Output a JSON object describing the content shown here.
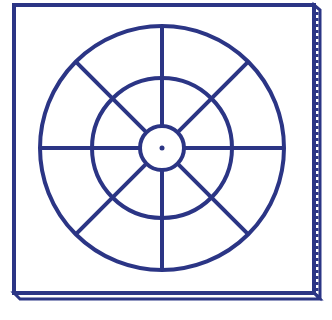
{
  "diagram": {
    "stroke_color": "#2b3585",
    "background": "#ffffff",
    "board": {
      "x": 14,
      "y": 5,
      "width": 300,
      "height": 288
    },
    "center": {
      "x": 162,
      "y": 148
    },
    "circles": [
      {
        "name": "outer",
        "r": 122
      },
      {
        "name": "middle",
        "r": 70
      },
      {
        "name": "inner",
        "r": 22
      }
    ],
    "spokes": 8,
    "center_dot": true
  }
}
